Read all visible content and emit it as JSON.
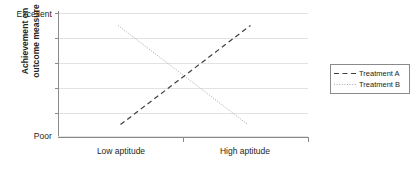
{
  "chart_data": {
    "type": "line",
    "title": "",
    "subtitle": "",
    "xlabel": "",
    "ylabel_lines": [
      "Achievement on",
      "outcome measure"
    ],
    "ylabel": "Achievement on outcome measure",
    "grid": true,
    "gridline_count": 6,
    "legend_position": "right",
    "x": [
      0,
      1
    ],
    "categories": [
      "Low aptitude",
      "High aptitude"
    ],
    "xticklabels": [
      "Low aptitude",
      "High aptitude"
    ],
    "yticklabels": [
      "Excellent",
      "Poor"
    ],
    "ylim": [
      0,
      100
    ],
    "y_top_label": "Excellent",
    "y_bottom_label": "Poor",
    "series": [
      {
        "name": "Treatment A",
        "style": "dashed",
        "color": "#3f3f3f",
        "values": [
          10,
          90
        ],
        "points": [
          {
            "x": 0.25,
            "y": 10
          },
          {
            "x": 0.77,
            "y": 90
          }
        ]
      },
      {
        "name": "Treatment B",
        "style": "dotted",
        "color": "#a6a6a6",
        "values": [
          90,
          10
        ],
        "points": [
          {
            "x": 0.24,
            "y": 90
          },
          {
            "x": 0.76,
            "y": 10
          }
        ]
      }
    ],
    "annotations": [],
    "interaction": "crossover"
  },
  "axes": {
    "y": {
      "top_tick_label": "Excellent",
      "bottom_tick_label": "Poor",
      "title_line1": "Achievement on",
      "title_line2": "outcome measure"
    },
    "x": {
      "tick_label_left": "Low aptitude",
      "tick_label_right": "High aptitude"
    }
  },
  "legend": {
    "items": [
      {
        "label": "Treatment A",
        "style": "dashed"
      },
      {
        "label": "Treatment B",
        "style": "dotted"
      }
    ]
  },
  "colors": {
    "axis": "#8a8a8a",
    "grid": "#e2e2e2",
    "treatment_a": "#3f3f3f",
    "treatment_b": "#a6a6a6",
    "text": "#231f20",
    "background": "#ffffff"
  }
}
